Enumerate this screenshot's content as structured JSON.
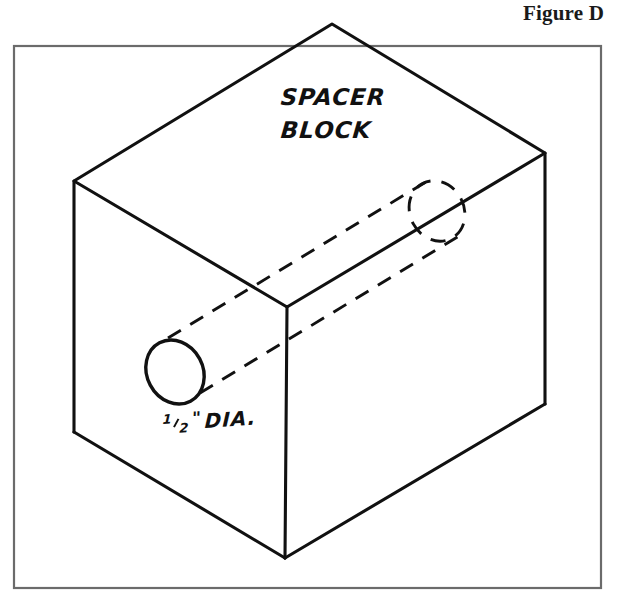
{
  "figure": {
    "caption": "Figure D"
  },
  "drawing": {
    "title": "Isometric drawing of a spacer block with a through hole",
    "labels": {
      "part_name_line1": "SPACER",
      "part_name_line2": "BLOCK",
      "dimension_numerator": "1",
      "dimension_denominator": "2",
      "dimension_inch_mark": "\"",
      "dimension_text": "DIA."
    },
    "colors": {
      "ink": "#111111",
      "frame": "#6b6b6b",
      "paper": "#ffffff"
    },
    "geometry": {
      "frame": {
        "x": 14,
        "y": 46,
        "width": 587,
        "height": 542
      },
      "cube_vertices": {
        "top_apex": [
          332,
          24
        ],
        "left_top": [
          74,
          181
        ],
        "right_top": [
          545,
          153
        ],
        "front_top": [
          287,
          307
        ],
        "left_bottom": [
          74,
          432
        ],
        "right_bottom": [
          545,
          404
        ],
        "front_bottom": [
          285,
          558
        ]
      },
      "hole_front_ellipse": {
        "cx": 175,
        "cy": 372,
        "rx": 28,
        "ry": 33,
        "rotate": -28
      },
      "hole_back_ellipse": {
        "cx": 437,
        "cy": 211,
        "rx": 27,
        "ry": 31,
        "rotate": -28
      },
      "hole_axis_upper": [
        [
          168,
          338
        ],
        [
          432,
          178
        ]
      ],
      "hole_axis_lower": [
        [
          200,
          393
        ],
        [
          462,
          234
        ]
      ]
    }
  }
}
